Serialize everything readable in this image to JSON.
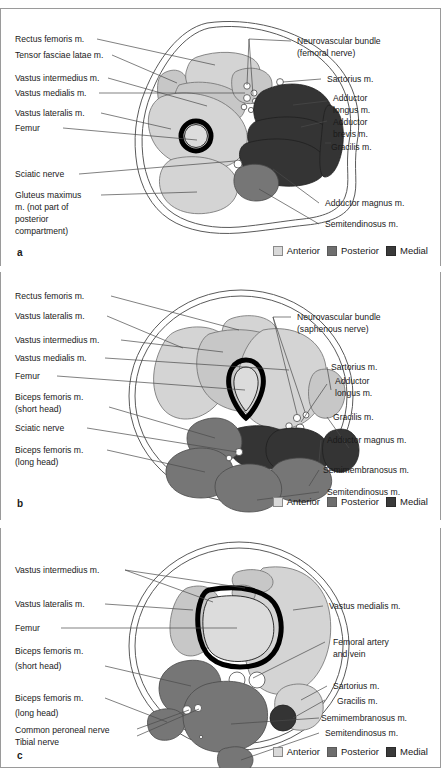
{
  "figure": {
    "type": "anatomical-cross-section-series"
  },
  "legend": {
    "items": [
      {
        "label": "Anterior",
        "color": "#d9d9d9",
        "name": "legend-anterior"
      },
      {
        "label": "Posterior",
        "color": "#6e6e6e",
        "name": "legend-posterior"
      },
      {
        "label": "Medial",
        "color": "#3a3a3a",
        "name": "legend-medial"
      }
    ]
  },
  "panels": [
    {
      "letter": "a",
      "left_labels": [
        "Rectus femoris m.",
        "Tensor fasciae latae m.",
        "Vastus intermedius m.",
        "Vastus medialis m.",
        "Vastus lateralis m.",
        "Femur",
        "Sciatic nerve",
        "Gluteus maximus",
        "m. (not part of",
        "posterior",
        "compartment)"
      ],
      "right_labels": [
        "Neurovascular bundle",
        "(femoral nerve)",
        "Sartorius m.",
        "Adductor",
        "longus m.",
        "Adductor",
        "brevis m.",
        "Gracilis m.",
        "Adductor magnus m.",
        "Semitendinosus m."
      ]
    },
    {
      "letter": "b",
      "left_labels": [
        "Rectus femoris m.",
        "Vastus lateralis m.",
        "Vastus intermedius m.",
        "Vastus medialis m.",
        "Femur",
        "Biceps femoris m.",
        "(short head)",
        "Sciatic nerve",
        "Biceps femoris m.",
        "(long head)"
      ],
      "right_labels": [
        "Neurovascular bundle",
        "(saphenous nerve)",
        "Sartorius m.",
        "Adductor",
        "longus m.",
        "Gracilis m.",
        "Adductor magnus m.",
        "Semimembranosus m.",
        "Semitendinosus m."
      ]
    },
    {
      "letter": "c",
      "left_labels": [
        "Vastus intermedius m.",
        "Vastus lateralis m.",
        "Femur",
        "Biceps femoris m.",
        "(short head)",
        "Biceps femoris m.",
        "(long head)",
        "Common peroneal nerve",
        "Tibial nerve"
      ],
      "right_labels": [
        "Vastus medialis m.",
        "Femoral artery",
        "and vein",
        "Sartorius m.",
        "Gracilis m.",
        "Semimembranosus m.",
        "Semitendinosus m."
      ]
    }
  ]
}
